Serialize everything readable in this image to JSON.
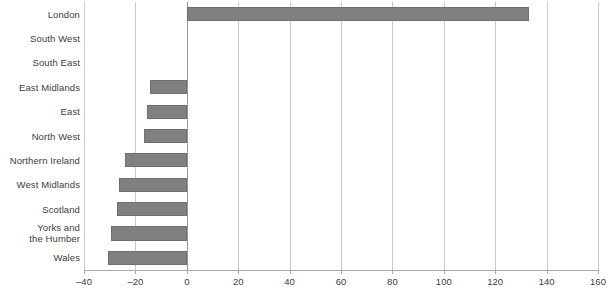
{
  "chart_data": {
    "type": "bar",
    "orientation": "horizontal",
    "title": "",
    "subtitle": "",
    "xlabel": "",
    "ylabel": "",
    "categories": [
      "London",
      "South West",
      "South East",
      "East Midlands",
      "East",
      "North West",
      "Northern Ireland",
      "West Midlands",
      "Scotland",
      "Yorks and\nthe Humber",
      "Wales"
    ],
    "values": [
      133,
      0,
      0,
      -14.5,
      -15.5,
      -16.5,
      -24,
      -26.5,
      -27,
      -29.5,
      -30.5
    ],
    "xlim": [
      -40,
      160
    ],
    "ylim": null,
    "xticks": [
      -40,
      -20,
      0,
      20,
      40,
      60,
      80,
      100,
      120,
      140,
      160
    ],
    "xtick_labels": [
      "–40",
      "–20",
      "0",
      "20",
      "40",
      "60",
      "80",
      "100",
      "120",
      "140",
      "160"
    ],
    "grid": "vertical",
    "legend": null,
    "legend_position": "none",
    "series": [
      {
        "name": "value",
        "values": [
          133,
          0,
          0,
          -14.5,
          -15.5,
          -16.5,
          -24,
          -26.5,
          -27,
          -29.5,
          -30.5
        ]
      }
    ],
    "annotations": []
  },
  "style": {
    "bar_color": "#808080",
    "bar_border_color": "#6f6f6f",
    "grid_color": "#c9c9c9",
    "axis_color": "#a8a8a8",
    "zero_line_color": "#9a9a9a",
    "text_color": "#3d3d3d",
    "background": "#ffffff"
  }
}
